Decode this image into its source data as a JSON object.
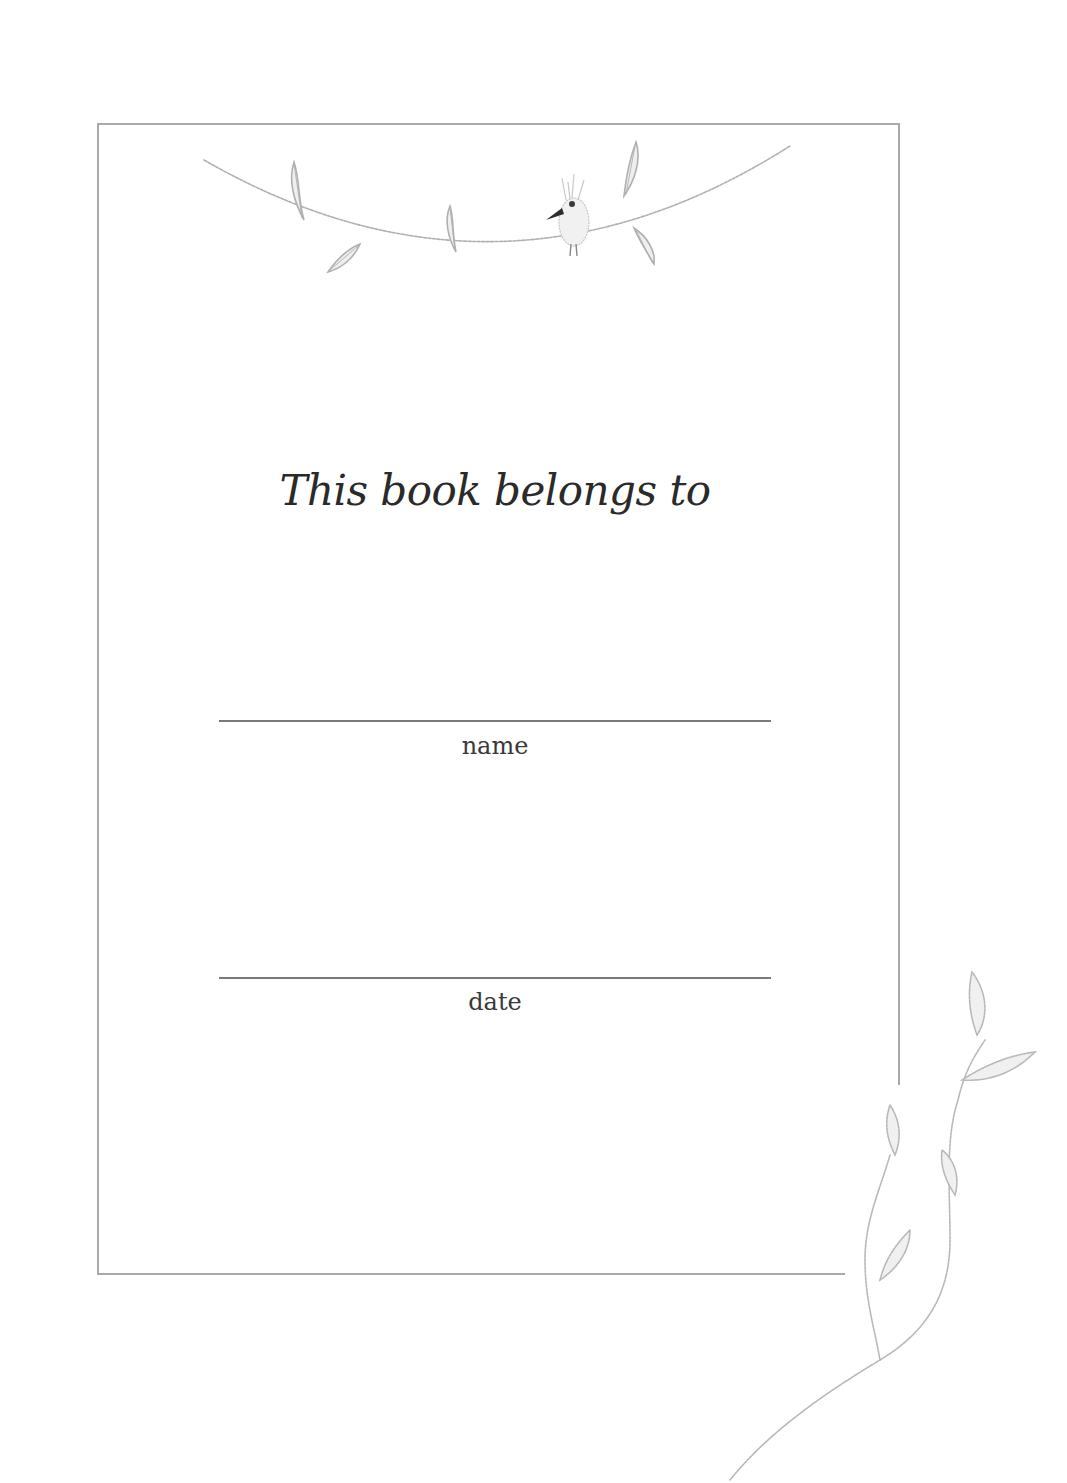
{
  "page": {
    "heading": "This book belongs to",
    "fields": [
      {
        "label": "name",
        "value": ""
      },
      {
        "label": "date",
        "value": ""
      }
    ]
  },
  "decorations": {
    "top": "garland-with-bird-and-leaves",
    "bottom_right": "leafy-vine"
  },
  "colors": {
    "frame": "#a9a9a9",
    "text": "#2a2a2a",
    "line": "#7a7a7a",
    "pencil": "#b5b5b5"
  }
}
